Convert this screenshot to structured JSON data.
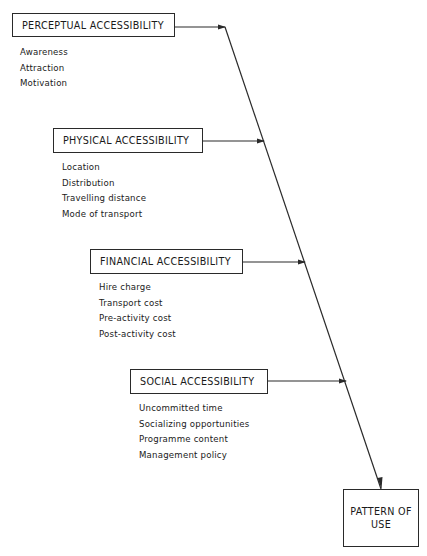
{
  "diagram": {
    "factors": [
      {
        "label": "PERCEPTUAL ACCESSIBILITY",
        "items": [
          "Awareness",
          "Attraction",
          "Motivation"
        ]
      },
      {
        "label": "PHYSICAL ACCESSIBILITY",
        "items": [
          "Location",
          "Distribution",
          "Travelling distance",
          "Mode of transport"
        ]
      },
      {
        "label": "FINANCIAL ACCESSIBILITY",
        "items": [
          "Hire charge",
          "Transport cost",
          "Pre-activity cost",
          "Post-activity cost"
        ]
      },
      {
        "label": "SOCIAL ACCESSIBILITY",
        "items": [
          "Uncommitted time",
          "Socializing opportunities",
          "Programme content",
          "Management policy"
        ]
      }
    ],
    "result": {
      "line1": "PATTERN OF",
      "line2": "USE"
    },
    "colors": {
      "line": "#2a2a2a",
      "background": "#ffffff"
    }
  }
}
